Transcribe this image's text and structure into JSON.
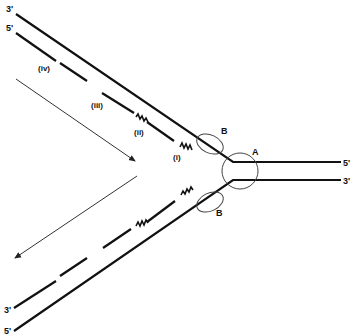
{
  "diagram": {
    "labels": {
      "top_left_3": "3'",
      "top_left_5": "5'",
      "right_top_5": "5'",
      "right_bottom_3": "3'",
      "bottom_left_3": "3'",
      "bottom_left_5": "5'",
      "helicase": "A",
      "ssb_top": "B",
      "ssb_bottom": "B",
      "fragment_i": "(i)",
      "fragment_ii": "(ii)",
      "fragment_iii": "(iii)",
      "fragment_iv": "(iv)"
    },
    "colors": {
      "strand": "#111111",
      "arrow": "#333333",
      "background": "#ffffff"
    }
  }
}
